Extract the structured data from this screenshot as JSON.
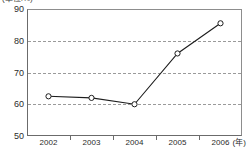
{
  "chart_data": {
    "type": "line",
    "title": "",
    "subtitle": "",
    "unit_caption": "(単位:%)",
    "xlabel": "",
    "xunit": "(年)",
    "ylabel": "",
    "categories": [
      "2002",
      "2003",
      "2004",
      "2005",
      "2006"
    ],
    "values": [
      62.5,
      62.0,
      60.0,
      76.0,
      85.5
    ],
    "series": [
      {
        "name": "series-1",
        "values": [
          62.5,
          62.0,
          60.0,
          76.0,
          85.5
        ],
        "line_color": "#1d1d1d",
        "marker": "open-circle"
      }
    ],
    "ylim": [
      50,
      90
    ],
    "yticks": [
      50,
      60,
      70,
      80,
      90
    ],
    "ytick_labels": [
      "50",
      "60",
      "70",
      "80",
      "90"
    ],
    "gridlines": [
      60,
      70,
      80
    ],
    "grid": true,
    "grid_style": "dashed",
    "legend": false,
    "legend_position": "none",
    "axis_color": "#6b6b6b"
  }
}
